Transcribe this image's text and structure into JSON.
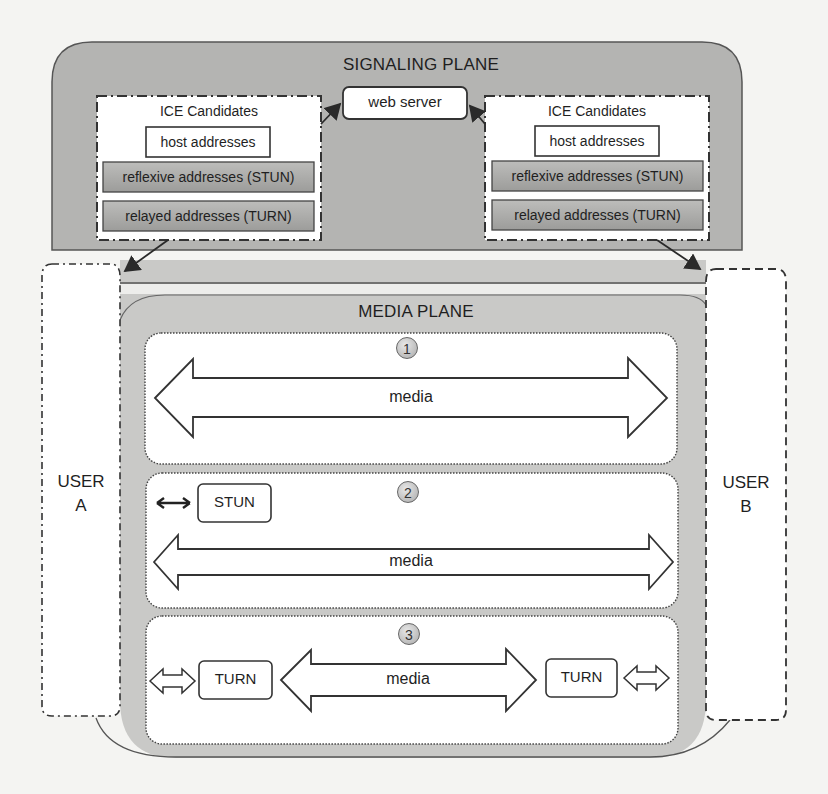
{
  "signaling_plane": {
    "title": "SIGNALING PLANE",
    "web_server": "web server",
    "ice_left": {
      "title": "ICE Candidates",
      "host": "host addresses",
      "reflexive": "reflexive addresses (STUN)",
      "relayed": "relayed addresses (TURN)"
    },
    "ice_right": {
      "title": "ICE Candidates",
      "host": "host addresses",
      "reflexive": "reflexive addresses (STUN)",
      "relayed": "relayed addresses (TURN)"
    }
  },
  "users": {
    "a": {
      "line1": "USER",
      "line2": "A"
    },
    "b": {
      "line1": "USER",
      "line2": "B"
    }
  },
  "media_plane": {
    "title": "MEDIA PLANE",
    "scenarios": [
      {
        "number": "1",
        "media_label": "media"
      },
      {
        "number": "2",
        "media_label": "media",
        "server": "STUN"
      },
      {
        "number": "3",
        "media_label": "media",
        "server_left": "TURN",
        "server_right": "TURN"
      }
    ]
  },
  "colors": {
    "signaling_fill": "#b4b4b2",
    "media_fill": "#c9c9c7",
    "panel_fill": "#ffffff",
    "address_box_fill": "#a9a9a7",
    "stroke": "#3a3a3a"
  }
}
